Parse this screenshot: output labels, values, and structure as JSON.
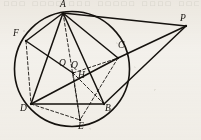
{
  "figure": {
    "background_color": "#f5f3ef",
    "ink_color": "#15120e",
    "bleed_through_text": "□□□ □□□□ □□□ □□□□□ □□□□ □□□",
    "circle": {
      "name": "main-circle",
      "cx": 72,
      "cy": 69,
      "r": 57.5,
      "stroke_width": 1.6,
      "style": "solid"
    },
    "points": [
      {
        "id": "A",
        "label": "A",
        "x": 63,
        "y": 13,
        "label_x": 60,
        "label_y": 0,
        "on_circle": true,
        "dot": true
      },
      {
        "id": "F",
        "label": "F",
        "x": 26,
        "y": 41,
        "label_x": 13,
        "label_y": 29,
        "on_circle": true,
        "dot": true
      },
      {
        "id": "C",
        "label": "C",
        "x": 118,
        "y": 58,
        "label_x": 118,
        "label_y": 41,
        "on_circle": true,
        "dot": true
      },
      {
        "id": "D",
        "label": "D",
        "x": 31,
        "y": 104,
        "label_x": 20,
        "label_y": 104,
        "on_circle": true,
        "dot": true
      },
      {
        "id": "B",
        "label": "B",
        "x": 104,
        "y": 104,
        "label_x": 105,
        "label_y": 104,
        "on_circle": true,
        "dot": true
      },
      {
        "id": "E",
        "label": "E",
        "x": 80,
        "y": 120,
        "label_x": 78,
        "label_y": 122,
        "on_circle": true,
        "dot": true
      },
      {
        "id": "O",
        "label": "O",
        "x": 70,
        "y": 70,
        "label_x": 59,
        "label_y": 59,
        "on_circle": false,
        "dot": false
      },
      {
        "id": "Q",
        "label": "Q",
        "x": 73,
        "y": 73,
        "label_x": 71,
        "label_y": 61,
        "on_circle": false,
        "dot": true
      },
      {
        "id": "H",
        "label": "H",
        "x": 73,
        "y": 73,
        "label_x": 78,
        "label_y": 71,
        "on_circle": false,
        "dot": false
      },
      {
        "id": "P",
        "label": "P",
        "x": 186,
        "y": 26,
        "label_x": 180,
        "label_y": 14,
        "on_circle": false,
        "dot": true
      }
    ],
    "solid_segments": [
      {
        "name": "segment-A-F",
        "from": "A",
        "to": "F"
      },
      {
        "name": "segment-A-D",
        "from": "A",
        "to": "D"
      },
      {
        "name": "segment-A-C",
        "from": "A",
        "to": "C"
      },
      {
        "name": "segment-A-P",
        "from": "A",
        "to": "P"
      },
      {
        "name": "segment-C-P",
        "from": "C",
        "to": "P"
      },
      {
        "name": "segment-B-P",
        "from": "B",
        "to": "P"
      },
      {
        "name": "segment-D-C",
        "from": "D",
        "to": "C"
      },
      {
        "name": "segment-D-B",
        "from": "D",
        "to": "B"
      },
      {
        "name": "segment-A-B",
        "from": "A",
        "to": "B"
      },
      {
        "name": "segment-F-H",
        "from": "F",
        "to": "H"
      }
    ],
    "dashed_segments": [
      {
        "name": "segment-F-D-dashed",
        "from": "F",
        "to": "D"
      },
      {
        "name": "segment-H-C-dashed",
        "from": "H",
        "to": "C"
      },
      {
        "name": "segment-A-E-dashed",
        "from": "A",
        "to": "E"
      },
      {
        "name": "segment-D-E-dashed",
        "from": "D",
        "to": "E"
      },
      {
        "name": "segment-C-E-dashed",
        "from": "C",
        "to": "E"
      },
      {
        "name": "segment-H-E-dashed",
        "from": "H",
        "to": "E"
      },
      {
        "name": "segment-B-H-dashed",
        "from": "B",
        "to": "H"
      }
    ],
    "dash_pattern": "3 2.2",
    "stroke_width_solid": 1.5,
    "stroke_width_dashed": 0.9
  }
}
